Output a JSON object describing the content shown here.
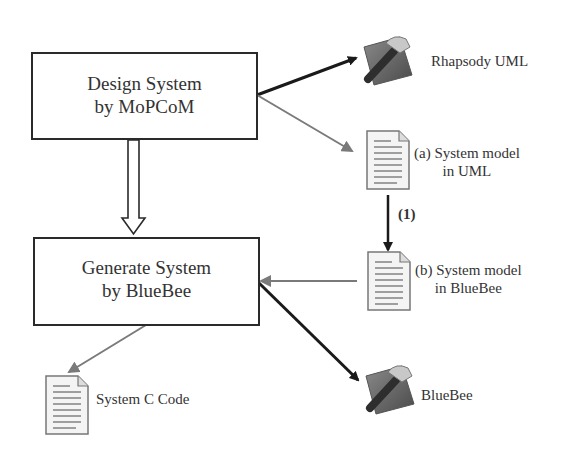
{
  "diagram": {
    "boxes": {
      "design": {
        "line1": "Design System",
        "line2": "by MoPCoM"
      },
      "generate": {
        "line1": "Generate System",
        "line2": "by BlueBee"
      }
    },
    "tools": {
      "rhapsody": {
        "label": "Rhapsody UML",
        "icon": "tool-hammer-icon"
      },
      "bluebee": {
        "label": "BlueBee",
        "icon": "tool-hammer-icon"
      }
    },
    "documents": {
      "model_uml": {
        "line1": "(a) System model",
        "line2": "in UML",
        "icon": "document-icon"
      },
      "model_bluebee": {
        "line1": "(b) System model",
        "line2": "in BlueBee",
        "icon": "document-icon"
      },
      "systemc": {
        "label": "System C Code",
        "icon": "document-icon"
      }
    },
    "step_label": "(1)",
    "colors": {
      "dark_arrow": "#1a1a1a",
      "gray_arrow": "#7a7a7a",
      "box_border": "#2a2a2a"
    }
  }
}
